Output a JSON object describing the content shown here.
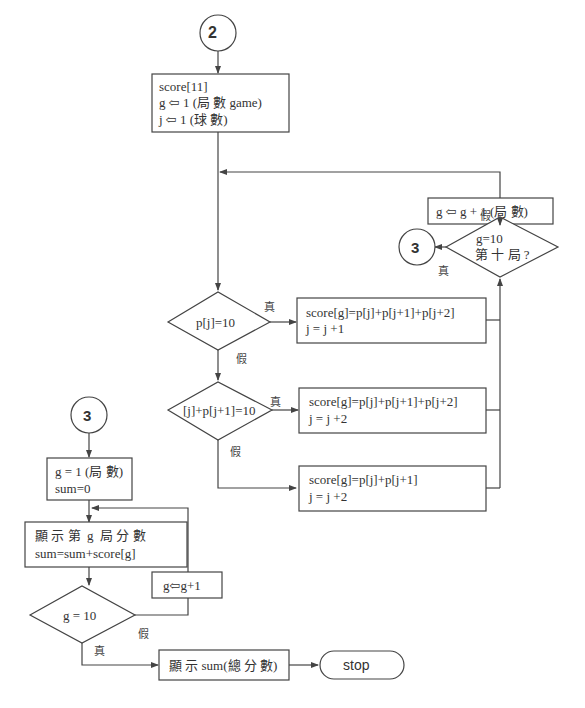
{
  "connectors": {
    "top": {
      "label": "2"
    },
    "right": {
      "label": "3"
    },
    "left": {
      "label": "3"
    }
  },
  "init_box": {
    "line1": "score[11]",
    "line2": "g ⇦ 1 (局 數 game)",
    "line3": "j ⇦ 1 (球 數)"
  },
  "decision1": {
    "label": "p[j]=10",
    "true_label": "真",
    "false_label": "假"
  },
  "process1": {
    "line1": "score[g]=p[j]+p[j+1]+p[j+2]",
    "line2": "j = j +1"
  },
  "decision2": {
    "label": "[j]+p[j+1]=10",
    "true_label": "真",
    "false_label": "假"
  },
  "process2": {
    "line1": "score[g]=p[j]+p[j+1]+p[j+2]",
    "line2": "j = j +2"
  },
  "process3": {
    "line1": "score[g]=p[j]+p[j+1]",
    "line2": "j = j +2"
  },
  "increment_box": {
    "label": "g ⇦ g + 1 (局 數)"
  },
  "decision3": {
    "line1": "g=10",
    "line2": "第 十 局 ?",
    "true_label": "真",
    "false_label": "假"
  },
  "sum_init_box": {
    "line1": "g = 1 (局 數)",
    "line2": "sum=0"
  },
  "display_box": {
    "line1": "顯 示 第  g  局 分 數",
    "line2": "sum=sum+score[g]"
  },
  "increment2_box": {
    "label": "g⇦g+1"
  },
  "decision4": {
    "label": "g = 10",
    "true_label": "真",
    "false_label": "假"
  },
  "final_box": {
    "label": "顯 示 sum(總 分 數)"
  },
  "terminator": {
    "label": "stop"
  },
  "colors": {
    "line": "#444444",
    "text": "#333333",
    "background": "#ffffff"
  }
}
